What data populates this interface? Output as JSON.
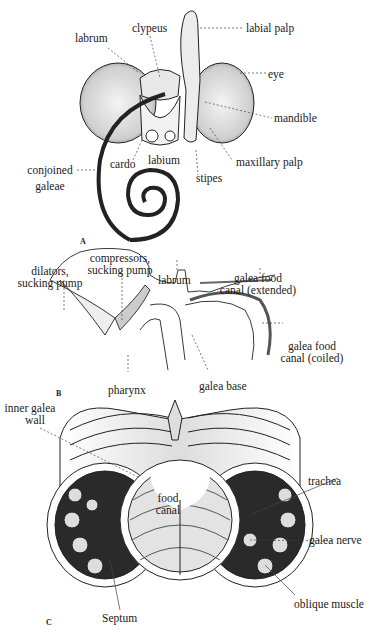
{
  "figure": {
    "panels": [
      {
        "id": "A",
        "letter": "A",
        "labels": {
          "clypeus": "clypeus",
          "labial_palp": "labial palp",
          "labrum": "labrum",
          "eye": "eye",
          "mandible": "mandible",
          "cardo": "cardo",
          "labium": "labium",
          "maxillary_palp": "maxillary palp",
          "conjoined_galeae_1": "conjoined",
          "conjoined_galeae_2": "galeae",
          "stipes": "stipes"
        }
      },
      {
        "id": "B",
        "letter": "B",
        "labels": {
          "dilators_1": "dilators,",
          "dilators_2": "sucking pump",
          "compressors_1": "compressors,",
          "compressors_2": "sucking pump",
          "labrum": "labrum",
          "galea_ext_1": "galea food",
          "galea_ext_2": "canal (extended)",
          "galea_coil_1": "galea food",
          "galea_coil_2": "canal (coiled)",
          "pharynx": "pharynx",
          "galea_base": "galea base"
        }
      },
      {
        "id": "C",
        "letter": "C",
        "labels": {
          "inner_galea_1": "inner galea",
          "inner_galea_2": "wall",
          "food_1": "food",
          "food_2": "canal",
          "trachea": "trachea",
          "galea_nerve": "galea nerve",
          "oblique_muscle": "oblique muscle",
          "septum": "Septum"
        }
      }
    ]
  }
}
